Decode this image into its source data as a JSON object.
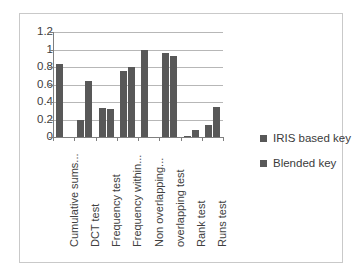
{
  "chart_data": {
    "type": "bar",
    "title": "",
    "subtitle": "",
    "xlabel": "",
    "ylabel": "",
    "ylim": [
      0,
      1.2
    ],
    "ytick_labels": [
      "0",
      "0.2",
      "0.4",
      "0.6",
      "0.8",
      "1",
      "1.2"
    ],
    "ytick_values": [
      0,
      0.2,
      0.4,
      0.6,
      0.8,
      1,
      1.2
    ],
    "grid": true,
    "legend_position": "right",
    "categories": [
      "Cumulative sums...",
      "DCT test",
      "Frequency test",
      "Frequency within...",
      "Non overlapping...",
      "overlapping  test",
      "Rank test",
      "Runs test"
    ],
    "series": [
      {
        "name": "IRIS based key",
        "color": "#585858",
        "values": [
          0.84,
          0.2,
          0.33,
          0.755,
          1.0,
          0.955,
          0.01,
          0.14
        ]
      },
      {
        "name": "Blended key",
        "color": "#585858",
        "values": [
          0.0,
          0.64,
          0.315,
          0.8,
          0.0,
          0.93,
          0.08,
          0.34
        ]
      }
    ]
  },
  "legend": {
    "items": [
      {
        "label": "IRIS based key"
      },
      {
        "label": "Blended key"
      }
    ]
  },
  "colors": {
    "bar": "#585858",
    "gridline": "#b7b7b7",
    "axis": "#7f7f7f",
    "border": "#c9c9c9",
    "text": "#404040",
    "background": "#ffffff"
  }
}
